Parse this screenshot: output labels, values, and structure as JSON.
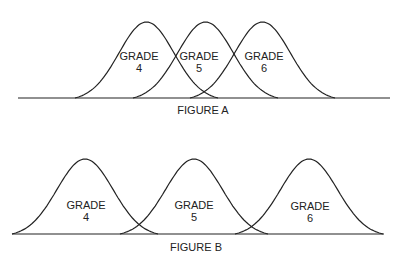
{
  "figures": [
    {
      "caption": "FIGURE A",
      "axis": {
        "x1": 18,
        "x2": 390,
        "y": 98
      },
      "caption_pos": {
        "x": 203,
        "y": 106
      },
      "curves": [
        {
          "grade_label": "GRADE",
          "grade_num": "4",
          "start": 75,
          "end": 218,
          "peak_y": 22,
          "label_x": 139,
          "label_y": 50
        },
        {
          "grade_label": "GRADE",
          "grade_num": "5",
          "start": 133,
          "end": 278,
          "peak_y": 22,
          "label_x": 199,
          "label_y": 50
        },
        {
          "grade_label": "GRADE",
          "grade_num": "6",
          "start": 190,
          "end": 335,
          "peak_y": 22,
          "label_x": 264,
          "label_y": 50
        }
      ]
    },
    {
      "caption": "FIGURE B",
      "axis": {
        "x1": 12,
        "x2": 384,
        "y": 234
      },
      "caption_pos": {
        "x": 196,
        "y": 242
      },
      "curves": [
        {
          "grade_label": "GRADE",
          "grade_num": "4",
          "start": 12,
          "end": 158,
          "peak_y": 159,
          "label_x": 86,
          "label_y": 199
        },
        {
          "grade_label": "GRADE",
          "grade_num": "5",
          "start": 120,
          "end": 268,
          "peak_y": 159,
          "label_x": 194,
          "label_y": 199
        },
        {
          "grade_label": "GRADE",
          "grade_num": "6",
          "start": 235,
          "end": 383,
          "peak_y": 159,
          "label_x": 310,
          "label_y": 200
        }
      ]
    }
  ],
  "labels": {
    "a4": "GRADE",
    "a4n": "4",
    "a5": "GRADE",
    "a5n": "5",
    "a6": "GRADE",
    "a6n": "6",
    "b4": "GRADE",
    "b4n": "4",
    "b5": "GRADE",
    "b5n": "5",
    "b6": "GRADE",
    "b6n": "6",
    "capA": "FIGURE A",
    "capB": "FIGURE B"
  }
}
